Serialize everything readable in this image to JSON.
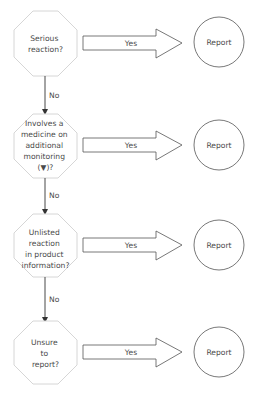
{
  "diagram": {
    "type": "flowchart",
    "colors": {
      "octagon_stroke": "#d6d6d6",
      "arrow_stroke": "#555555",
      "circle_stroke": "#555555",
      "connector": "#333333",
      "text": "#4a4a4a"
    },
    "steps": [
      {
        "question_lines": [
          "Serious",
          "reaction?"
        ],
        "yes_label": "Yes",
        "outcome": "Report",
        "no_label": "No"
      },
      {
        "question_lines": [
          "Involves a",
          "medicine on",
          "additional",
          "monitoring",
          "(▼)?"
        ],
        "yes_label": "Yes",
        "outcome": "Report",
        "no_label": "No"
      },
      {
        "question_lines": [
          "Unlisted",
          "reaction",
          "in product",
          "information?"
        ],
        "yes_label": "Yes",
        "outcome": "Report",
        "no_label": "No"
      },
      {
        "question_lines": [
          "Unsure",
          "to",
          "report?"
        ],
        "yes_label": "Yes",
        "outcome": "Report"
      }
    ]
  }
}
